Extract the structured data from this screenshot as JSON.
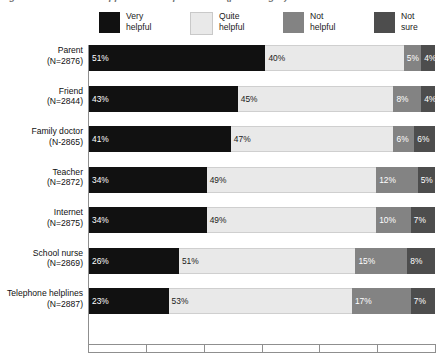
{
  "title": "Figure 2.5 Sources of support: how helpful was it? (percentages)",
  "legend": {
    "position": "top",
    "items": [
      {
        "label": "Very\nhelpful",
        "color": "#111111",
        "key": "very_helpful"
      },
      {
        "label": "Quite\nhelpful",
        "color": "#e9e9e9",
        "key": "quite_helpful"
      },
      {
        "label": "Not\nhelpful",
        "color": "#838383",
        "key": "not_helpful"
      },
      {
        "label": "Not\nsure",
        "color": "#4d4d4d",
        "key": "not_sure"
      }
    ]
  },
  "axis": {
    "tick_labels": [],
    "tick_count": 6,
    "xlim": [
      0,
      100
    ]
  },
  "chart_data": {
    "type": "bar",
    "orientation": "horizontal",
    "stacked": true,
    "stack_total": 100,
    "title": "Figure 2.5 Sources of support: how helpful was it? (percentages)",
    "xlabel": "",
    "ylabel": "",
    "xlim": [
      0,
      100
    ],
    "grid": false,
    "legend_position": "top",
    "categories": [
      "Parent",
      "Friend",
      "Family doctor",
      "Teacher",
      "Internet",
      "School nurse",
      "Telephone helplines"
    ],
    "category_counts": [
      "(N=2876)",
      "(N=2844)",
      "(N-2865)",
      "(N=2872)",
      "(N=2875)",
      "(N=2869)",
      "(N=2887)"
    ],
    "series": [
      {
        "name": "Very helpful",
        "color": "#111111",
        "values": [
          51,
          43,
          41,
          34,
          34,
          26,
          23
        ]
      },
      {
        "name": "Quite helpful",
        "color": "#e9e9e9",
        "values": [
          40,
          45,
          47,
          49,
          49,
          51,
          53
        ]
      },
      {
        "name": "Not helpful",
        "color": "#838383",
        "values": [
          5,
          8,
          6,
          12,
          10,
          15,
          17
        ]
      },
      {
        "name": "Not sure",
        "color": "#4d4d4d",
        "values": [
          4,
          4,
          6,
          5,
          7,
          8,
          7
        ]
      }
    ],
    "rows": [
      {
        "label": "Parent",
        "count": "(N=2876)",
        "segments": [
          {
            "key": "very_helpful",
            "value": 51,
            "text": "51%"
          },
          {
            "key": "quite_helpful",
            "value": 40,
            "text": "40%"
          },
          {
            "key": "not_helpful",
            "value": 5,
            "text": "5%"
          },
          {
            "key": "not_sure",
            "value": 4,
            "text": "4%"
          }
        ]
      },
      {
        "label": "Friend",
        "count": "(N=2844)",
        "segments": [
          {
            "key": "very_helpful",
            "value": 43,
            "text": "43%"
          },
          {
            "key": "quite_helpful",
            "value": 45,
            "text": "45%"
          },
          {
            "key": "not_helpful",
            "value": 8,
            "text": "8%"
          },
          {
            "key": "not_sure",
            "value": 4,
            "text": "4%"
          }
        ]
      },
      {
        "label": "Family doctor",
        "count": "(N-2865)",
        "segments": [
          {
            "key": "very_helpful",
            "value": 41,
            "text": "41%"
          },
          {
            "key": "quite_helpful",
            "value": 47,
            "text": "47%"
          },
          {
            "key": "not_helpful",
            "value": 6,
            "text": "6%"
          },
          {
            "key": "not_sure",
            "value": 6,
            "text": "6%"
          }
        ]
      },
      {
        "label": "Teacher",
        "count": "(N=2872)",
        "segments": [
          {
            "key": "very_helpful",
            "value": 34,
            "text": "34%"
          },
          {
            "key": "quite_helpful",
            "value": 49,
            "text": "49%"
          },
          {
            "key": "not_helpful",
            "value": 12,
            "text": "12%"
          },
          {
            "key": "not_sure",
            "value": 5,
            "text": "5%"
          }
        ]
      },
      {
        "label": "Internet",
        "count": "(N=2875)",
        "segments": [
          {
            "key": "very_helpful",
            "value": 34,
            "text": "34%"
          },
          {
            "key": "quite_helpful",
            "value": 49,
            "text": "49%"
          },
          {
            "key": "not_helpful",
            "value": 10,
            "text": "10%"
          },
          {
            "key": "not_sure",
            "value": 7,
            "text": "7%"
          }
        ]
      },
      {
        "label": "School nurse",
        "count": "(N=2869)",
        "segments": [
          {
            "key": "very_helpful",
            "value": 26,
            "text": "26%"
          },
          {
            "key": "quite_helpful",
            "value": 51,
            "text": "51%"
          },
          {
            "key": "not_helpful",
            "value": 15,
            "text": "15%"
          },
          {
            "key": "not_sure",
            "value": 8,
            "text": "8%"
          }
        ]
      },
      {
        "label": "Telephone helplines",
        "count": "(N=2887)",
        "segments": [
          {
            "key": "very_helpful",
            "value": 23,
            "text": "23%"
          },
          {
            "key": "quite_helpful",
            "value": 53,
            "text": "53%"
          },
          {
            "key": "not_helpful",
            "value": 17,
            "text": "17%"
          },
          {
            "key": "not_sure",
            "value": 7,
            "text": "7%"
          }
        ]
      }
    ]
  }
}
